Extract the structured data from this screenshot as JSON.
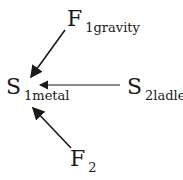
{
  "nodes": {
    "f1": {
      "main": "F",
      "sub": "1gravity"
    },
    "s1": {
      "main": "S",
      "sub": "1metal"
    },
    "s2": {
      "main": "S",
      "sub": "2ladle"
    },
    "f2": {
      "main": "F",
      "sub": "2"
    }
  },
  "edges": [
    {
      "from": "F1gravity",
      "to": "S1metal"
    },
    {
      "from": "S2ladle",
      "to": "S1metal"
    },
    {
      "from": "F2",
      "to": "S1metal"
    }
  ]
}
